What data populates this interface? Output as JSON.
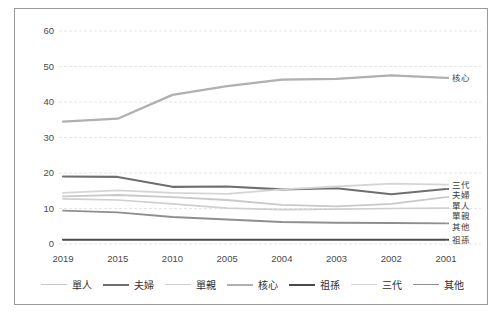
{
  "chart_data": {
    "type": "line",
    "title": "",
    "xlabel": "",
    "ylabel": "",
    "categories": [
      "2019",
      "2015",
      "2010",
      "2005",
      "2004",
      "2003",
      "2002",
      "2001"
    ],
    "ylim": [
      0,
      60
    ],
    "ytick_values": [
      0,
      10,
      20,
      30,
      40,
      50,
      60
    ],
    "ytick_labels": [
      "0",
      "10",
      "20",
      "30",
      "40",
      "50",
      "60"
    ],
    "grid": "horizontal-dashed",
    "legend_position": "bottom",
    "series": [
      {
        "name": "單人",
        "end_label": "單人",
        "color": "#c9c9c9",
        "width": 1.8,
        "values": [
          13.4,
          13.8,
          13.2,
          12.4,
          11.0,
          10.6,
          11.3,
          13.2
        ]
      },
      {
        "name": "夫婦",
        "end_label": "夫婦",
        "color": "#6f6f6f",
        "width": 2.1,
        "values": [
          19.0,
          18.9,
          16.1,
          16.2,
          15.4,
          15.7,
          14.0,
          15.5
        ]
      },
      {
        "name": "單親",
        "end_label": "單親",
        "color": "#cfcfcf",
        "width": 1.7,
        "values": [
          12.7,
          12.4,
          11.3,
          10.1,
          9.7,
          9.8,
          10.0,
          10.1
        ]
      },
      {
        "name": "核心",
        "end_label": "核心",
        "color": "#b0b0b0",
        "width": 2.3,
        "values": [
          34.5,
          35.3,
          42.0,
          44.5,
          46.3,
          46.5,
          47.5,
          46.8
        ]
      },
      {
        "name": "祖孫",
        "end_label": "祖孫",
        "color": "#4a4a4a",
        "width": 2.2,
        "values": [
          1.2,
          1.2,
          1.2,
          1.2,
          1.2,
          1.2,
          1.2,
          1.2
        ]
      },
      {
        "name": "三代",
        "end_label": "三代",
        "color": "#d5d5d5",
        "width": 1.8,
        "values": [
          14.4,
          15.1,
          14.4,
          14.1,
          15.4,
          16.2,
          17.0,
          16.7
        ]
      },
      {
        "name": "其他",
        "end_label": "其他",
        "color": "#8f8f8f",
        "width": 1.9,
        "values": [
          9.4,
          8.9,
          7.6,
          6.9,
          6.2,
          6.0,
          5.9,
          5.8
        ]
      }
    ]
  },
  "legend": {
    "items": [
      {
        "label": "單人"
      },
      {
        "label": "夫婦"
      },
      {
        "label": "單親"
      },
      {
        "label": "核心"
      },
      {
        "label": "祖孫"
      },
      {
        "label": "三代"
      },
      {
        "label": "其他"
      }
    ]
  }
}
